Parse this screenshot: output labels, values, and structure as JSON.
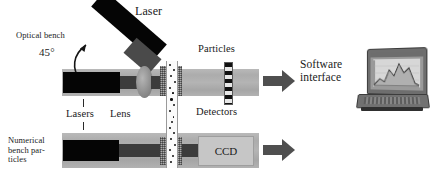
{
  "figure": {
    "type": "optical-measurement-system-diagram",
    "background_color": "#ffffff"
  },
  "labels": {
    "optical_bench": "Optical bench",
    "angle": "45°",
    "laser": "Laser",
    "particles": "Particles",
    "detectors": "Detectors",
    "lasers": "Lasers",
    "lens": "Lens",
    "numerical_bench_particles": "Numerical\nbench par-\nticles",
    "ccd": "CCD",
    "software_interface": "Software\ninterface"
  },
  "colors": {
    "bench_band": "#b0b0b0",
    "laser_body": "#050505",
    "beam": "#3c3c3c",
    "lens": "#8e8e8e",
    "arrow": "#4f4f4f",
    "ccd_box": "#c6c6c6",
    "detector_dark": "#111111",
    "detector_light": "#e8e8e8",
    "text": "#1a1a1a"
  },
  "components": {
    "upper_bench": {
      "name": "optical bench",
      "elements": [
        "laser",
        "beam",
        "lens",
        "particle column",
        "scattered beam",
        "detectors"
      ]
    },
    "lower_bench": {
      "name": "numerical bench",
      "elements": [
        "lasers",
        "beam",
        "particle column",
        "CCD"
      ]
    },
    "output": {
      "name": "software interface",
      "device": "laptop computer",
      "screen_content": "line chart / spectrum plot"
    }
  },
  "particle_column": {
    "dot_count": 34,
    "description": "vertical white channel seeded with dark particles, flanked by hatched blocks"
  },
  "arrows": {
    "count": 2,
    "direction": "right",
    "targets": [
      "software interface",
      "software interface"
    ]
  }
}
